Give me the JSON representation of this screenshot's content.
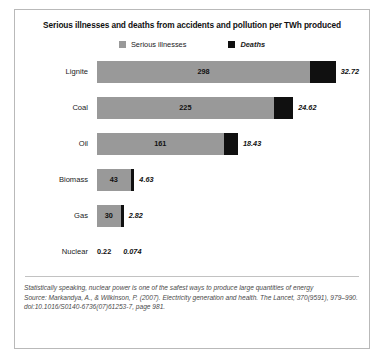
{
  "chart_data": {
    "type": "bar",
    "title": "Serious illnesses and deaths from accidents and pollution per TWh produced",
    "xlabel": "",
    "ylabel": "",
    "orientation": "horizontal",
    "stacked": true,
    "grid": false,
    "legend_position": "top-center",
    "xlim": [
      0,
      331
    ],
    "categories": [
      "Lignite",
      "Coal",
      "Oil",
      "Biomass",
      "Gas",
      "Nuclear"
    ],
    "series": [
      {
        "name": "Serious illnesses",
        "color": "#999999",
        "values": [
          298,
          225,
          161,
          43,
          30,
          0.22
        ],
        "labels": [
          "298",
          "225",
          "161",
          "43",
          "30",
          "0.22"
        ]
      },
      {
        "name": "Deaths",
        "color": "#101010",
        "values": [
          32.72,
          24.62,
          18.43,
          4.63,
          2.82,
          0.074
        ],
        "labels": [
          "32.72",
          "24.62",
          "18.43",
          "4.63",
          "2.82",
          "0.074"
        ]
      }
    ],
    "annotations": [
      "Statistically speaking, nuclear power is one of the safest ways to produce large quantities of energy",
      "Source: Markandya, A., & Wilkinson, P. (2007). Electricity generation and health. The Lancet, 370(9591), 979–990. doi:10.1016/S0140-6736(07)61253-7, page 981."
    ]
  },
  "legend": {
    "items": [
      {
        "label": "Serious illnesses",
        "color": "#999999",
        "italic": false
      },
      {
        "label": "Deaths",
        "color": "#101010",
        "italic": true
      }
    ]
  },
  "rows": [
    {
      "label": "Lignite",
      "ill": "298",
      "death": "32.72",
      "ill_pct": 89.0,
      "death_pct": 9.8,
      "inside": true
    },
    {
      "label": "Coal",
      "ill": "225",
      "death": "24.62",
      "ill_pct": 67.2,
      "death_pct": 7.4,
      "inside": true
    },
    {
      "label": "Oil",
      "ill": "161",
      "death": "18.43",
      "ill_pct": 48.1,
      "death_pct": 5.5,
      "inside": true
    },
    {
      "label": "Biomass",
      "ill": "43",
      "death": "4.63",
      "ill_pct": 12.8,
      "death_pct": 1.4,
      "inside": true
    },
    {
      "label": "Gas",
      "ill": "30",
      "death": "2.82",
      "ill_pct": 9.0,
      "death_pct": 0.9,
      "inside": true
    },
    {
      "label": "Nuclear",
      "ill": "0.22",
      "death": "0.074",
      "ill_pct": 0,
      "death_pct": 0,
      "inside": false
    }
  ],
  "footnote": {
    "line1": "Statistically speaking, nuclear power is one of the safest ways to produce large quantities of energy",
    "line2": "Source: Markandya, A., & Wilkinson, P. (2007). Electricity generation and health. The Lancet, 370(9591), 979–990. doi:10.1016/S0140-6736(07)61253-7, page 981."
  }
}
